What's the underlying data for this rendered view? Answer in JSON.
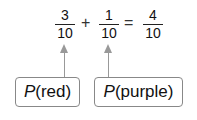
{
  "equation": {
    "term1": {
      "numerator": "3",
      "denominator": "10"
    },
    "op1": "+",
    "term2": {
      "numerator": "1",
      "denominator": "10"
    },
    "op2": "=",
    "result": {
      "numerator": "4",
      "denominator": "10"
    }
  },
  "labels": [
    {
      "func": "P",
      "arg": "(red)"
    },
    {
      "func": "P",
      "arg": "(purple)"
    }
  ],
  "colors": {
    "arrow": "#999999",
    "box_border": "#888888"
  }
}
